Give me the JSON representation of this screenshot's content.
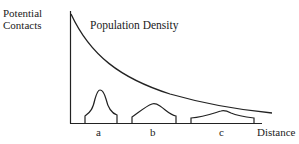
{
  "diagram": {
    "y_axis_label_line1": "Potential",
    "y_axis_label_line2": "Contacts",
    "curve_label": "Population Density",
    "x_axis_label": "Distance",
    "peaks": [
      {
        "label": "a"
      },
      {
        "label": "b"
      },
      {
        "label": "c"
      }
    ],
    "line_color": "#222222"
  }
}
